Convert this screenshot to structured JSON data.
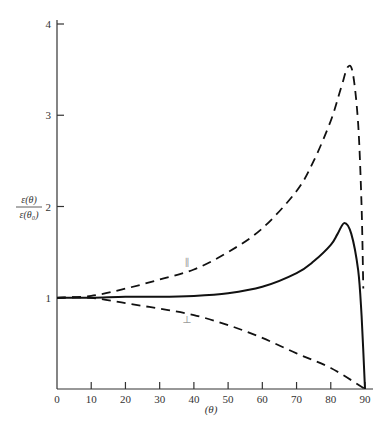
{
  "chart_data": {
    "type": "line",
    "title": "",
    "xlabel": "(θ)",
    "ylabel_num": "ε(θ)",
    "ylabel_den": "ε(θ₀)",
    "xlim": [
      0,
      90
    ],
    "ylim": [
      0,
      4
    ],
    "xticks": [
      0,
      10,
      20,
      30,
      40,
      50,
      60,
      70,
      80,
      90
    ],
    "yticks": [
      1,
      2,
      3,
      4
    ],
    "grid": false,
    "legend": "none",
    "series": [
      {
        "name": "parallel",
        "label": "∥",
        "style": "dashed",
        "x": [
          0,
          10,
          20,
          30,
          40,
          50,
          60,
          70,
          75,
          80,
          83,
          85,
          86.5,
          88,
          89,
          89.5
        ],
        "y": [
          1.0,
          1.02,
          1.1,
          1.2,
          1.31,
          1.5,
          1.76,
          2.17,
          2.5,
          2.94,
          3.3,
          3.53,
          3.45,
          2.9,
          2.0,
          1.1
        ]
      },
      {
        "name": "total",
        "label": "",
        "style": "solid",
        "x": [
          0,
          10,
          20,
          30,
          40,
          50,
          60,
          70,
          75,
          80,
          82,
          84,
          86,
          88,
          89,
          90
        ],
        "y": [
          1.0,
          1.0,
          1.01,
          1.01,
          1.02,
          1.05,
          1.12,
          1.27,
          1.4,
          1.58,
          1.7,
          1.82,
          1.7,
          1.3,
          0.8,
          0.0
        ]
      },
      {
        "name": "perpendicular",
        "label": "⊥",
        "style": "dashed",
        "x": [
          0,
          10,
          20,
          30,
          40,
          50,
          60,
          70,
          80,
          90
        ],
        "y": [
          1.0,
          1.0,
          0.94,
          0.88,
          0.81,
          0.7,
          0.56,
          0.39,
          0.23,
          0.0
        ]
      }
    ],
    "annotations": [
      {
        "text": "∥",
        "x": 38,
        "y": 1.35
      },
      {
        "text": "⊥",
        "x": 38,
        "y": 0.72
      }
    ]
  }
}
